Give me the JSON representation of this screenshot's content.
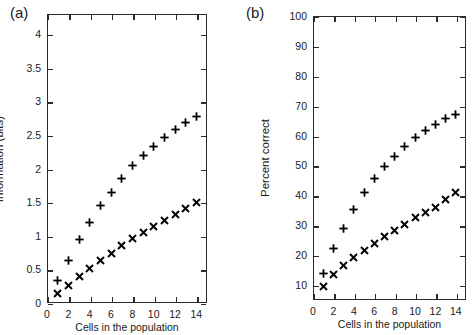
{
  "figure": {
    "width": 475,
    "height": 335,
    "background": "#ffffff",
    "ink_color": "#1a1a1a"
  },
  "panels": [
    {
      "id": "a",
      "label": "(a)",
      "chart_data": {
        "type": "scatter",
        "title": "",
        "xlabel": "Cells in the population",
        "ylabel": "Information (bits)",
        "xlim": [
          0,
          15
        ],
        "ylim": [
          0,
          4.3
        ],
        "xticks": [
          0,
          2,
          4,
          6,
          8,
          10,
          12,
          14
        ],
        "xtick_labels": [
          "0",
          "2",
          "4",
          "6",
          "8",
          "10",
          "12",
          "14"
        ],
        "yticks": [
          0,
          0.5,
          1,
          1.5,
          2,
          2.5,
          3,
          3.5,
          4
        ],
        "ytick_labels": [
          "0",
          "0.5",
          "1",
          "1.5",
          "2",
          "2.5",
          "3",
          "3.5",
          "4"
        ],
        "grid": false,
        "legend": "none",
        "x": [
          1,
          2,
          3,
          4,
          5,
          6,
          7,
          8,
          9,
          10,
          11,
          12,
          13,
          14
        ],
        "series": [
          {
            "name": "plus-series",
            "marker": "plus",
            "color": "#000000",
            "values": [
              0.33,
              0.63,
              0.94,
              1.2,
              1.45,
              1.65,
              1.85,
              2.04,
              2.19,
              2.33,
              2.46,
              2.58,
              2.68,
              2.77
            ]
          },
          {
            "name": "cross-series",
            "marker": "cross",
            "color": "#000000",
            "values": [
              0.14,
              0.26,
              0.39,
              0.51,
              0.63,
              0.74,
              0.85,
              0.96,
              1.05,
              1.14,
              1.23,
              1.32,
              1.41,
              1.49
            ]
          }
        ]
      }
    },
    {
      "id": "b",
      "label": "(b)",
      "chart_data": {
        "type": "scatter",
        "title": "",
        "xlabel": "Cells in the population",
        "ylabel": "Percent correct",
        "xlim": [
          0,
          15
        ],
        "ylim": [
          5,
          100
        ],
        "xticks": [
          0,
          2,
          4,
          6,
          8,
          10,
          12,
          14
        ],
        "xtick_labels": [
          "0",
          "2",
          "4",
          "6",
          "8",
          "10",
          "12",
          "14"
        ],
        "yticks": [
          10,
          20,
          30,
          40,
          50,
          60,
          70,
          80,
          90,
          100
        ],
        "ytick_labels": [
          "10",
          "20",
          "30",
          "40",
          "50",
          "60",
          "70",
          "80",
          "90",
          "100"
        ],
        "grid": false,
        "legend": "none",
        "x": [
          1,
          2,
          3,
          4,
          5,
          6,
          7,
          8,
          9,
          10,
          11,
          12,
          13,
          14
        ],
        "series": [
          {
            "name": "plus-series",
            "marker": "plus",
            "color": "#000000",
            "values": [
              14.0,
              22.1,
              29.0,
              35.3,
              41.1,
              45.5,
              49.5,
              53.0,
              56.4,
              59.3,
              61.7,
              63.7,
              65.7,
              67.1
            ]
          },
          {
            "name": "cross-series",
            "marker": "cross",
            "color": "#000000",
            "values": [
              9.5,
              13.6,
              16.7,
              19.1,
              21.6,
              23.9,
              26.4,
              28.2,
              30.1,
              32.6,
              34.2,
              36.1,
              38.5,
              40.8
            ]
          }
        ]
      }
    }
  ]
}
